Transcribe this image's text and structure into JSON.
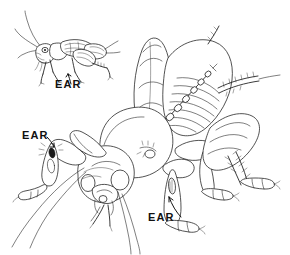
{
  "figure": {
    "background_color": "#ffffff",
    "ink_color": "#1a1a1a",
    "style": "black and white pen-and-ink line drawing",
    "width": 290,
    "height": 255
  },
  "labels": {
    "ear_text": "EAR",
    "items": [
      {
        "id": "ear-label-inset",
        "text": "EAR",
        "x": 55,
        "y": 88,
        "points_to": "foreleg tibia of small inset cricket"
      },
      {
        "id": "ear-label-left",
        "text": "EAR",
        "x": 22,
        "y": 139,
        "points_to": "left foreleg tympanum of large cricket"
      },
      {
        "id": "ear-label-bottom",
        "text": "EAR",
        "x": 148,
        "y": 221,
        "points_to": "right foreleg tympanum of large cricket"
      }
    ]
  },
  "subjects": [
    {
      "id": "inset-cricket",
      "name": "small cricket side view",
      "description": "complete cricket shown in profile facing left with long antennae, folded wings, and raised hind leg",
      "position": "top-left"
    },
    {
      "id": "main-cricket",
      "name": "large cricket front-oblique view",
      "description": "enlarged cricket viewed from the front and slightly above showing head, mouthparts, pronotum, stridulating wing with file, forelegs bearing tympana, and spined hind legs",
      "position": "center-right"
    }
  ],
  "anatomy_callouts": [
    "tympanum on foreleg tibia",
    "stridulatory file on forewing",
    "pronotum",
    "compound eye",
    "maxillary palps",
    "spined hind tibia",
    "tarsal claws",
    "filiform antennae"
  ]
}
